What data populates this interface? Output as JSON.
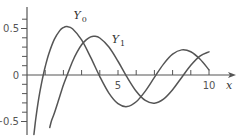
{
  "chart_data": {
    "type": "line",
    "title": "",
    "xlabel": "x",
    "ylabel": "",
    "xlim": [
      0,
      10.5
    ],
    "ylim": [
      -0.6,
      0.65
    ],
    "grid": false,
    "legend": "inline labels",
    "x_ticks": [
      1,
      2,
      3,
      4,
      5,
      6,
      7,
      8,
      9,
      10
    ],
    "x_tick_labels": [
      {
        "value": 5,
        "label": "5"
      },
      {
        "value": 10,
        "label": "10"
      }
    ],
    "y_ticks": [
      -0.5,
      -0.4,
      -0.3,
      -0.2,
      -0.1,
      0,
      0.1,
      0.2,
      0.3,
      0.4,
      0.5,
      0.6
    ],
    "y_tick_labels": [
      {
        "value": 0.5,
        "label": "0.5"
      },
      {
        "value": 0,
        "label": "0"
      },
      {
        "value": -0.5,
        "label": "−0.5"
      }
    ],
    "series": [
      {
        "name": "Y0",
        "label_main": "Y",
        "label_sub": "0",
        "label_pos": [
          2.55,
          0.6
        ],
        "x": [
          0.38,
          0.45,
          0.5,
          0.6,
          0.7,
          0.8,
          0.9,
          1.0,
          1.2,
          1.5,
          1.8,
          2.0,
          2.2,
          2.5,
          3.0,
          3.5,
          4.0,
          4.5,
          5.0,
          5.5,
          6.0,
          6.5,
          7.0,
          7.5,
          8.0,
          8.5,
          9.0,
          9.5,
          10.0
        ],
        "values": [
          -0.64,
          -0.52,
          -0.4445,
          -0.3085,
          -0.1907,
          -0.0868,
          0.0056,
          0.0883,
          0.2281,
          0.3824,
          0.4774,
          0.5104,
          0.5208,
          0.4981,
          0.3769,
          0.189,
          -0.0169,
          -0.1947,
          -0.3085,
          -0.3395,
          -0.2882,
          -0.1732,
          -0.0259,
          0.1173,
          0.2235,
          0.2702,
          0.2499,
          0.1712,
          0.0557
        ]
      },
      {
        "name": "Y1",
        "label_main": "Y",
        "label_sub": "1",
        "label_pos": [
          4.65,
          0.34
        ],
        "x": [
          1.25,
          1.35,
          1.5,
          1.75,
          2.0,
          2.25,
          2.5,
          2.75,
          3.0,
          3.25,
          3.5,
          3.7,
          4.0,
          4.5,
          5.0,
          5.5,
          6.0,
          6.5,
          7.0,
          7.5,
          8.0,
          8.5,
          9.0,
          9.5,
          10.0
        ],
        "values": [
          -0.565,
          -0.49,
          -0.4123,
          -0.2612,
          -0.107,
          0.022,
          0.1459,
          0.2455,
          0.3247,
          0.3775,
          0.4102,
          0.4168,
          0.3979,
          0.301,
          0.1479,
          -0.0238,
          -0.175,
          -0.2741,
          -0.3027,
          -0.2591,
          -0.1581,
          -0.0262,
          0.1043,
          0.2032,
          0.249
        ]
      }
    ]
  },
  "style": {
    "axis_color": "#555555",
    "curve_color": "#555555",
    "text_color": "#555555"
  }
}
